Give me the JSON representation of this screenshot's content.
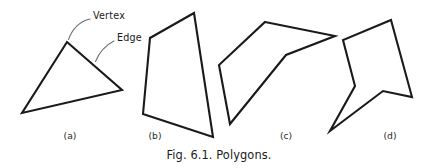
{
  "figure": {
    "caption": "Fig. 6.1. Polygons.",
    "background_color": "#ffffff",
    "stroke_color": "#1a1a1a",
    "leader_color": "#6f6f6f",
    "annotations": [
      {
        "name": "vertex",
        "label": "Vertex",
        "label_x": 93,
        "label_y": 16,
        "target_x": 68,
        "target_y": 41,
        "leader_path": "M 90 19 C 80 21, 72 29, 68.5 39.5"
      },
      {
        "name": "edge",
        "label": "Edge",
        "label_x": 117,
        "label_y": 38,
        "target_x": 95,
        "target_y": 63,
        "leader_path": "M 114 41 C 106 45, 99 53, 95.5 61.5"
      }
    ],
    "polygons": [
      {
        "id": "a",
        "label": "(a)",
        "label_x": 70,
        "label_y": 139,
        "kind": "convex-triangle",
        "vertex_count": 3,
        "points": "67,42 122,90 22,113"
      },
      {
        "id": "b",
        "label": "(b)",
        "label_x": 155,
        "label_y": 139,
        "kind": "convex-quadrilateral",
        "vertex_count": 4,
        "points": "194,13 213,137 143,114 150,38"
      },
      {
        "id": "c",
        "label": "(c)",
        "label_x": 286,
        "label_y": 139,
        "kind": "concave-pentagon",
        "vertex_count": 5,
        "points": "265,22 335,36 286,55 230,124 219,65"
      },
      {
        "id": "d",
        "label": "(d)",
        "label_x": 390,
        "label_y": 139,
        "kind": "concave-hexagon",
        "vertex_count": 6,
        "points": "391,20 412,97 383,91 330,131 355,86 343,40"
      }
    ],
    "caption_x": 219,
    "caption_y": 159
  }
}
